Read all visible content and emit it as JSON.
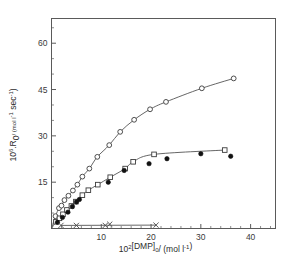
{
  "chart_data": {
    "type": "scatter",
    "title": "",
    "xlabel": "10²[DMP]₀ / (mol l⁻¹)",
    "ylabel": "10⁶·R₀ / (mol l⁻¹ sec⁻¹)",
    "xlabel_parts": {
      "base": "10",
      "exp": "2",
      "mid": "[DMP]",
      "sub": "0",
      "tail": "/ (mol l",
      "tail_exp": "-1",
      "tail_end": ")"
    },
    "ylabel_parts": {
      "base": "10",
      "exp": "6",
      "mid": ".R",
      "sub": "0",
      "tail": "/ (mol l",
      "tail_exp1": "-1",
      "tail_mid": " sec",
      "tail_exp2": "-1",
      "tail_end": ")"
    },
    "xlim": [
      0,
      45
    ],
    "ylim": [
      0,
      68
    ],
    "xticks": [
      10,
      20,
      30,
      40
    ],
    "xticklabels": [
      "10",
      "20",
      "30",
      "40"
    ],
    "yticks": [
      15,
      30,
      45,
      60
    ],
    "yticklabels": [
      "15",
      "30",
      "45",
      "60"
    ],
    "x_minor_step": 2,
    "y_minor_step": 5,
    "grid": false,
    "legend": "none",
    "frame": true,
    "tick_direction": "in",
    "series": [
      {
        "name": "open-circle-series",
        "marker": "open-circle",
        "has_curve": true,
        "color": "#3b3b3b",
        "points": [
          {
            "x": 0.8,
            "y": 4.0
          },
          {
            "x": 1.5,
            "y": 6.6
          },
          {
            "x": 2.0,
            "y": 7.4
          },
          {
            "x": 2.6,
            "y": 9.2
          },
          {
            "x": 3.4,
            "y": 10.6
          },
          {
            "x": 4.3,
            "y": 12.3
          },
          {
            "x": 5.2,
            "y": 14.2
          },
          {
            "x": 6.2,
            "y": 16.8
          },
          {
            "x": 7.6,
            "y": 19.4
          },
          {
            "x": 9.2,
            "y": 23.2
          },
          {
            "x": 11.6,
            "y": 27.0
          },
          {
            "x": 13.8,
            "y": 31.3
          },
          {
            "x": 16.6,
            "y": 35.2
          },
          {
            "x": 19.8,
            "y": 38.6
          },
          {
            "x": 23.0,
            "y": 41.0
          },
          {
            "x": 30.2,
            "y": 45.4
          },
          {
            "x": 36.6,
            "y": 48.6
          }
        ]
      },
      {
        "name": "open-square-series",
        "marker": "open-square",
        "has_curve": true,
        "color": "#3b3b3b",
        "points": [
          {
            "x": 0.9,
            "y": 2.2
          },
          {
            "x": 1.6,
            "y": 3.3
          },
          {
            "x": 2.3,
            "y": 4.6
          },
          {
            "x": 3.1,
            "y": 6.0
          },
          {
            "x": 4.0,
            "y": 7.3
          },
          {
            "x": 4.9,
            "y": 8.7
          },
          {
            "x": 6.2,
            "y": 10.8
          },
          {
            "x": 7.4,
            "y": 12.4
          },
          {
            "x": 9.3,
            "y": 14.2
          },
          {
            "x": 11.8,
            "y": 16.6
          },
          {
            "x": 14.8,
            "y": 19.4
          },
          {
            "x": 16.4,
            "y": 21.6
          },
          {
            "x": 20.6,
            "y": 24.0
          },
          {
            "x": 34.8,
            "y": 25.4
          }
        ]
      },
      {
        "name": "filled-circle-series",
        "marker": "filled-circle",
        "has_curve": false,
        "color": "#111111",
        "points": [
          {
            "x": 1.2,
            "y": 2.0
          },
          {
            "x": 2.2,
            "y": 3.6
          },
          {
            "x": 3.3,
            "y": 5.3
          },
          {
            "x": 4.2,
            "y": 7.1
          },
          {
            "x": 5.0,
            "y": 8.6
          },
          {
            "x": 5.6,
            "y": 9.4
          },
          {
            "x": 11.4,
            "y": 15.0
          },
          {
            "x": 14.6,
            "y": 18.8
          },
          {
            "x": 19.6,
            "y": 21.0
          },
          {
            "x": 23.2,
            "y": 22.6
          },
          {
            "x": 30.0,
            "y": 24.2
          },
          {
            "x": 36.0,
            "y": 23.4
          }
        ]
      },
      {
        "name": "cross-series",
        "marker": "cross",
        "has_curve": true,
        "color": "#4a4a4a",
        "points": [
          {
            "x": 1.9,
            "y": 1.0
          },
          {
            "x": 5.0,
            "y": 1.0
          },
          {
            "x": 10.8,
            "y": 1.0
          },
          {
            "x": 11.7,
            "y": 1.4
          },
          {
            "x": 21.0,
            "y": 1.1
          }
        ]
      }
    ]
  }
}
